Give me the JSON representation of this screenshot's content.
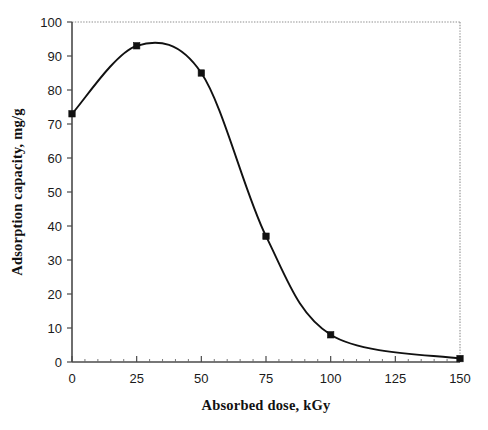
{
  "chart_data": {
    "type": "line",
    "title": "",
    "xlabel": "Absorbed dose, kGy",
    "ylabel": "Adsorption capacity, mg/g",
    "x": [
      0,
      25,
      50,
      75,
      100,
      150
    ],
    "values": [
      73,
      93,
      85,
      37,
      8,
      1
    ],
    "series": [
      {
        "name": "Adsorption capacity",
        "x": [
          0,
          25,
          50,
          75,
          100,
          150
        ],
        "values": [
          73,
          93,
          85,
          37,
          8,
          1
        ],
        "marker": "filled-square",
        "line_color": "#111111",
        "marker_color": "#111111"
      }
    ],
    "xlim": [
      0,
      150
    ],
    "ylim": [
      0,
      100
    ],
    "xticks": [
      0,
      25,
      50,
      75,
      100,
      125,
      150
    ],
    "yticks": [
      0,
      10,
      20,
      30,
      40,
      50,
      60,
      70,
      80,
      90,
      100
    ],
    "xtick_labels": [
      "0",
      "25",
      "50",
      "75",
      "100",
      "125",
      "150"
    ],
    "ytick_labels": [
      "0",
      "10",
      "20",
      "30",
      "40",
      "50",
      "60",
      "70",
      "80",
      "90",
      "100"
    ],
    "x_minor_tick_step": 5,
    "grid": false,
    "legend": false,
    "legend_position": "none",
    "frame": "dotted-top-right-border",
    "annotations": []
  },
  "figure": {
    "background_color": "#ffffff",
    "axis_color": "#4a4a4a",
    "frame_color": "#8d8d8d",
    "data_color": "#111111"
  }
}
